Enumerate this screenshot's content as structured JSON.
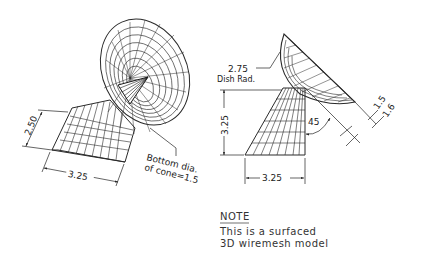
{
  "drawing": {
    "left_view": {
      "dim_height": "2.50",
      "dim_width": "3.25",
      "callout_line1": "Bottom dia.",
      "callout_line2": "of cone=1.5"
    },
    "right_view": {
      "dish_radius_value": "2.75",
      "dish_radius_label": "Dish Rad.",
      "dim_height": "3.25",
      "dim_width": "3.25",
      "angle": "45",
      "offset_a": "1.5",
      "offset_b": "1.6"
    },
    "note": {
      "title": "NOTE",
      "line1": "This is a surfaced",
      "line2": "3D wiremesh model"
    },
    "colors": {
      "line": "#1a1a1a",
      "mesh": "#2a2a2a",
      "background": "#ffffff"
    }
  }
}
